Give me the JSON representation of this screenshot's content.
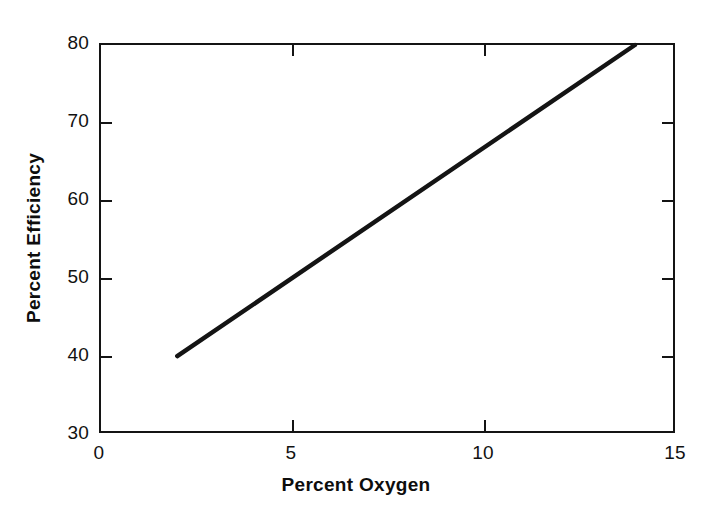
{
  "chart_data": {
    "type": "line",
    "title": "",
    "xlabel": "Percent Oxygen",
    "ylabel": "Percent Efficiency",
    "xlim": [
      0,
      15
    ],
    "ylim": [
      30,
      80
    ],
    "xticks": [
      0,
      5,
      10,
      15
    ],
    "yticks": [
      30,
      40,
      50,
      60,
      70,
      80
    ],
    "xticklabels": [
      "0",
      "5",
      "10",
      "15"
    ],
    "yticklabels": [
      "30",
      "40",
      "50",
      "60",
      "70",
      "80"
    ],
    "grid": false,
    "legend": null,
    "series": [
      {
        "name": "Efficiency vs Oxygen",
        "color": "#141414",
        "linewidth": 4,
        "x": [
          2.0,
          14.0
        ],
        "y": [
          39.7,
          80.0
        ],
        "points": [
          {
            "x": 2.0,
            "y": 39.7
          },
          {
            "x": 4.0,
            "y": 46.4
          },
          {
            "x": 6.0,
            "y": 53.2
          },
          {
            "x": 8.0,
            "y": 59.9
          },
          {
            "x": 10.0,
            "y": 66.6
          },
          {
            "x": 12.0,
            "y": 73.3
          },
          {
            "x": 14.0,
            "y": 80.0
          }
        ]
      }
    ],
    "annotations": [],
    "axis_style": {
      "frame": "full-box",
      "tick_direction": "in",
      "tick_sides": [
        "bottom",
        "top",
        "left",
        "right"
      ],
      "spine_color": "#141414",
      "background": "#ffffff"
    }
  },
  "figure": {
    "background_color": "#ffffff",
    "ink_color": "#141414"
  }
}
